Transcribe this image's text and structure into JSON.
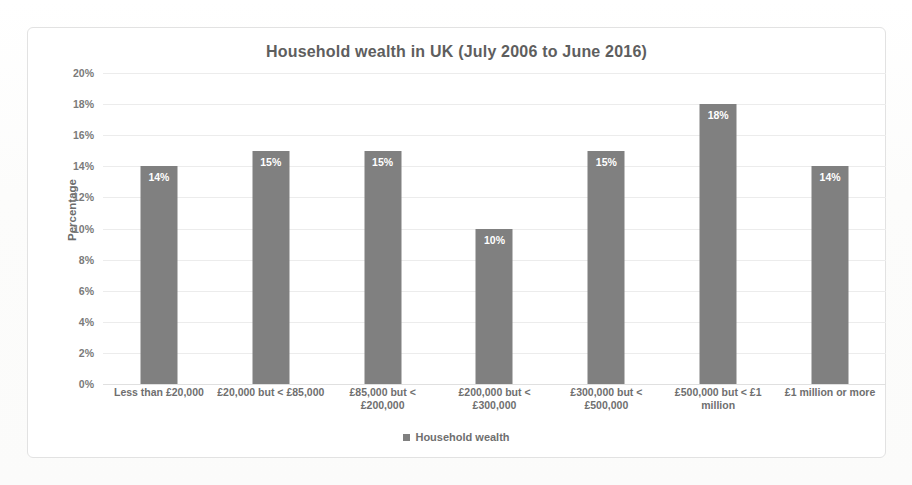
{
  "chart_data": {
    "type": "bar",
    "title": "Household wealth in UK (July 2006 to June 2016)",
    "xlabel": "",
    "ylabel": "Percentage",
    "ylim": [
      0,
      20
    ],
    "grid": true,
    "legend_position": "bottom",
    "series_name": "Household wealth",
    "bar_color": "#808080",
    "categories": [
      "Less than £20,000",
      "£20,000 but < £85,000",
      "£85,000 but < £200,000",
      "£200,000 but < £300,000",
      "£300,000 but < £500,000",
      "£500,000 but < £1 million",
      "£1 million or more"
    ],
    "values": [
      14,
      15,
      15,
      10,
      15,
      18,
      14
    ],
    "value_labels": [
      "14%",
      "15%",
      "15%",
      "10%",
      "15%",
      "18%",
      "14%"
    ],
    "ytick_labels": [
      "20%",
      "18%",
      "16%",
      "14%",
      "12%",
      "10%",
      "8%",
      "6%",
      "4%",
      "2%",
      "0%"
    ],
    "ytick_values": [
      20,
      18,
      16,
      14,
      12,
      10,
      8,
      6,
      4,
      2,
      0
    ]
  },
  "legend": {
    "entries": [
      {
        "label": "Household wealth",
        "color": "#808080",
        "marker": "square-marker"
      }
    ]
  }
}
